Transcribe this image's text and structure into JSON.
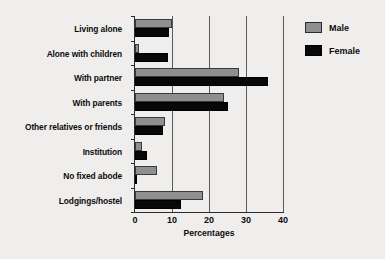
{
  "chart_data": {
    "type": "bar",
    "orientation": "horizontal",
    "title": "",
    "xlabel": "Percentages",
    "ylabel": "",
    "xlim": [
      0,
      40
    ],
    "xticks": [
      0,
      10,
      20,
      30,
      40
    ],
    "grid": true,
    "legend_position": "right",
    "categories": [
      "Living alone",
      "Alone with children",
      "With partner",
      "With parents",
      "Other relatives or friends",
      "Institution",
      "No fixed abode",
      "Lodgings/hostel"
    ],
    "series": [
      {
        "name": "Male",
        "color": "#8f8f8f",
        "values": [
          10.0,
          1.0,
          28.0,
          24.0,
          8.0,
          2.0,
          6.0,
          18.5
        ]
      },
      {
        "name": "Female",
        "color": "#080808",
        "values": [
          9.2,
          9.0,
          36.0,
          25.0,
          7.5,
          3.2,
          0.6,
          12.5
        ]
      }
    ]
  },
  "legend": {
    "items": [
      {
        "label": "Male"
      },
      {
        "label": "Female"
      }
    ]
  }
}
